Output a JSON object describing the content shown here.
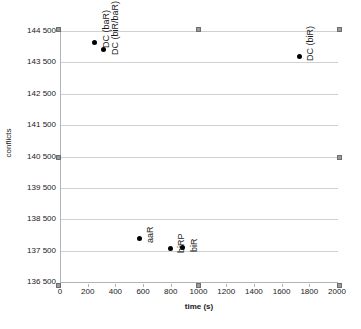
{
  "chart_data": {
    "type": "scatter",
    "title": "",
    "xlabel": "time (s)",
    "ylabel": "conflicts",
    "xlim": [
      0,
      2000
    ],
    "ylim": [
      136500,
      144500
    ],
    "grid": "horizontal",
    "legend": "none",
    "x_ticks": [
      0,
      200,
      400,
      600,
      800,
      1000,
      1200,
      1400,
      1600,
      1800,
      2000
    ],
    "x_tick_labels": [
      "0",
      "200",
      "400",
      "600",
      "800",
      "1000",
      "1200",
      "1400",
      "1600",
      "1800",
      "2000"
    ],
    "y_ticks": [
      136500,
      137500,
      138500,
      139500,
      140500,
      141500,
      142500,
      143500,
      144500
    ],
    "y_tick_labels": [
      "136 500",
      "137 500",
      "138 500",
      "139 500",
      "140 500",
      "141 500",
      "142 500",
      "143 500",
      "144 500"
    ],
    "points": [
      {
        "label": "DC (baR)",
        "x": 245,
        "y": 144120
      },
      {
        "label": "DC (biR/baR)",
        "x": 310,
        "y": 143900
      },
      {
        "label": "DC (biR)",
        "x": 1720,
        "y": 143700
      },
      {
        "label": "aaR",
        "x": 565,
        "y": 137900
      },
      {
        "label": "biRP",
        "x": 790,
        "y": 137570
      },
      {
        "label": "biR",
        "x": 880,
        "y": 137600
      }
    ]
  },
  "bottom_strip": {
    "text": ""
  },
  "colors": {
    "marker": "#000000",
    "gridline": "#d0d0d0",
    "axis": "#b3b3b3",
    "handle": "#9a9a9a",
    "text": "#1a1a1a",
    "background": "#ffffff"
  }
}
